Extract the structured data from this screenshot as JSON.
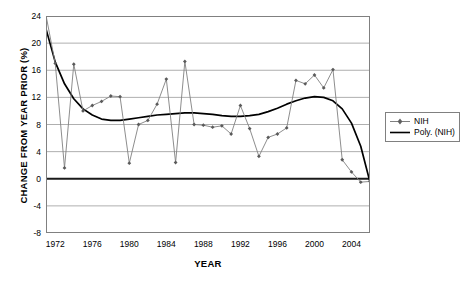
{
  "chart_data": {
    "type": "line",
    "title": "",
    "xlabel": "YEAR",
    "ylabel": "CHANGE FROM YEAR PRIOR (%)",
    "xlim": [
      1971,
      2006
    ],
    "ylim": [
      -8,
      24
    ],
    "ytick_labels": [
      "24",
      "20",
      "16",
      "12",
      "8",
      "4",
      "0",
      "-4",
      "-8"
    ],
    "ytick_values": [
      24,
      20,
      16,
      12,
      8,
      4,
      0,
      -4,
      -8
    ],
    "xtick_labels": [
      "1972",
      "1976",
      "1980",
      "1984",
      "1988",
      "1992",
      "1996",
      "2000",
      "2004"
    ],
    "xtick_values": [
      1972,
      1976,
      1980,
      1984,
      1988,
      1992,
      1996,
      2000,
      2004
    ],
    "grid": "horizontal",
    "legend_position": "right",
    "zero_line": true,
    "x": [
      1971,
      1972,
      1973,
      1974,
      1975,
      1976,
      1977,
      1978,
      1979,
      1980,
      1981,
      1982,
      1983,
      1984,
      1985,
      1986,
      1987,
      1988,
      1989,
      1990,
      1991,
      1992,
      1993,
      1994,
      1995,
      1996,
      1997,
      1998,
      1999,
      2000,
      2001,
      2002,
      2003,
      2004,
      2005,
      2006
    ],
    "series": [
      {
        "name": "NIH",
        "color": "#808080",
        "marker": "diamond",
        "values": [
          24.1,
          17.0,
          1.6,
          16.9,
          10.0,
          10.8,
          11.4,
          12.2,
          12.1,
          2.3,
          8.0,
          8.6,
          11.0,
          14.7,
          2.4,
          17.3,
          8.0,
          7.9,
          7.6,
          7.8,
          6.6,
          10.8,
          7.4,
          3.3,
          6.1,
          6.6,
          7.5,
          14.5,
          14.0,
          15.3,
          13.4,
          16.1,
          2.8,
          1.0,
          -0.5,
          -0.4
        ]
      },
      {
        "name": "Poly. (NIH)",
        "color": "#000000",
        "marker": "none",
        "values": [
          22.1,
          17.2,
          14.0,
          11.8,
          10.3,
          9.4,
          8.8,
          8.6,
          8.6,
          8.8,
          9.0,
          9.2,
          9.4,
          9.5,
          9.6,
          9.7,
          9.7,
          9.6,
          9.5,
          9.3,
          9.2,
          9.2,
          9.3,
          9.5,
          9.9,
          10.4,
          11.0,
          11.5,
          11.9,
          12.1,
          12.0,
          11.5,
          10.3,
          8.2,
          4.8,
          -0.5
        ]
      }
    ]
  },
  "legend": {
    "entries": [
      {
        "label": "NIH",
        "key": "line-with-diamond-marker"
      },
      {
        "label": "Poly. (NIH)",
        "key": "solid-line"
      }
    ]
  }
}
